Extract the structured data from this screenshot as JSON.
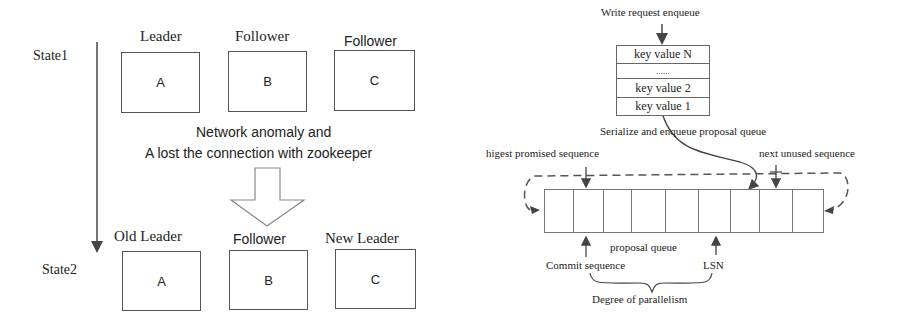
{
  "left_diagram": {
    "states": [
      "State1",
      "State2"
    ],
    "state1": {
      "roles": [
        "Leader",
        "Follower",
        "Follower"
      ],
      "nodes": [
        "A",
        "B",
        "C"
      ]
    },
    "transition": {
      "line1": "Network anomaly and",
      "line2": "A lost the connection with zookeeper"
    },
    "state2": {
      "roles": [
        "Old Leader",
        "Follower",
        "New Leader"
      ],
      "nodes": [
        "A",
        "B",
        "C"
      ]
    }
  },
  "right_diagram": {
    "write_request_label": "Write request enqueue",
    "write_queue": [
      "key value N",
      "......",
      "key value 2",
      "key value 1"
    ],
    "serialize_label": "Serialize and enqueue proposal queue",
    "highest_promised_label": "higest promised sequence",
    "next_unused_label": "next unused sequence",
    "proposal_queue_label": "proposal queue",
    "commit_sequence_label": "Commit sequence",
    "lsn_label": "LSN",
    "parallelism_label": "Degree of parallelism",
    "queue_cell_count": 9
  }
}
